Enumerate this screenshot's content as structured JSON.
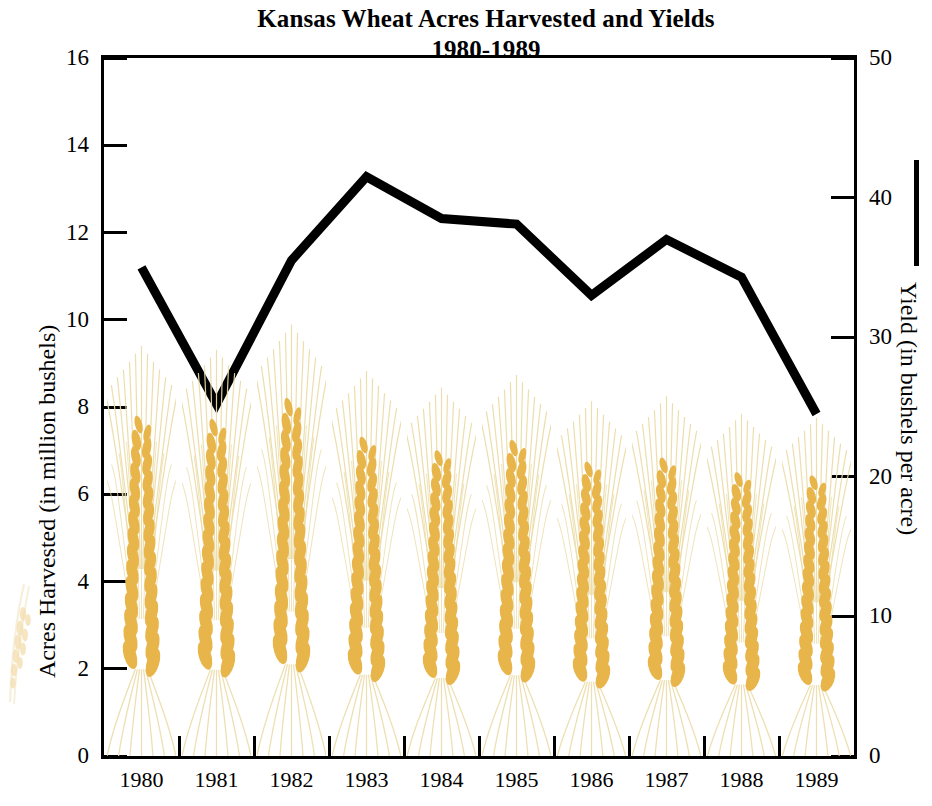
{
  "chart_data": {
    "type": "line",
    "title": "Kansas Wheat Acres Harvested and Yields",
    "subtitle": "1980-1989",
    "xlabel": "",
    "ylabel": "Acres Harvested (in million bushels)",
    "y2label": "Yield (in bushels per acre)",
    "categories": [
      "1980",
      "1981",
      "1982",
      "1983",
      "1984",
      "1985",
      "1986",
      "1987",
      "1988",
      "1989"
    ],
    "ylim": [
      0,
      16
    ],
    "yticks": [
      "0",
      "2",
      "4",
      "6",
      "8",
      "10",
      "12",
      "14",
      "16"
    ],
    "y2lim": [
      0,
      50
    ],
    "y2ticks": [
      "0",
      "10",
      "20",
      "30",
      "40",
      "50"
    ],
    "grid": false,
    "legend": "Yield (in bushels per acre)",
    "legend_position": "right-axis",
    "series": [
      {
        "name": "Yield (in bushels per acre)",
        "type": "line",
        "axis": "right",
        "color": "#000000",
        "values": [
          35.0,
          25.2,
          35.5,
          41.5,
          38.5,
          38.1,
          33.0,
          37.0,
          34.3,
          24.5
        ]
      },
      {
        "name": "Acres Harvested (in million bushels)",
        "type": "pictograph-wheat",
        "axis": "left",
        "color": "#E8B54B",
        "values": [
          9.7,
          9.6,
          10.2,
          9.1,
          8.7,
          9.0,
          8.4,
          8.5,
          8.1,
          8.0
        ]
      }
    ]
  },
  "axes": {
    "left": {
      "title": "Acres Harvested (in million bushels)",
      "ticks": [
        "16",
        "14",
        "12",
        "10",
        "8",
        "6",
        "4",
        "2",
        "0"
      ]
    },
    "right": {
      "title": "Yield (in bushels per acre)",
      "ticks": [
        "50",
        "40",
        "30",
        "20",
        "10",
        "0"
      ]
    },
    "bottom": {
      "ticks": [
        "1980",
        "1981",
        "1982",
        "1983",
        "1984",
        "1985",
        "1986",
        "1987",
        "1988",
        "1989"
      ]
    }
  },
  "colors": {
    "wheat_grain": "#E8B54B",
    "wheat_awn": "#EBDCA8",
    "line": "#000000",
    "frame": "#000000",
    "background": "#FFFFFF"
  },
  "icons": {
    "wheat": "wheat-stalk-icon",
    "legend_line": "line-swatch-icon"
  }
}
